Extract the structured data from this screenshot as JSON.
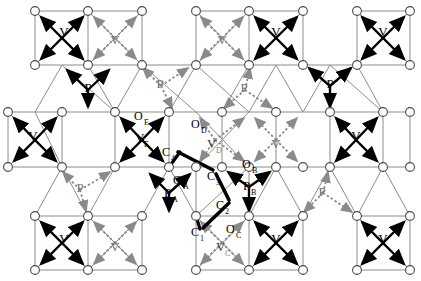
{
  "figure": {
    "name": "crystal-lattice-diagram",
    "type": "structural-lattice",
    "background_color": "#ffffff",
    "bond_color": "#000000",
    "lattice_line_color": "#8c8c8c",
    "node_fill": "#ffffff",
    "node_stroke": "#555555"
  },
  "atom_labels": {
    "oxygen": "O",
    "vanadium": "V",
    "phosphorus": "P",
    "carbon": "C"
  },
  "subscripts": {
    "a": "A",
    "b": "B",
    "c": "C",
    "d": "D",
    "e": "E",
    "one": "1",
    "two": "2",
    "three": "3",
    "four": "4"
  },
  "labelled_sites": [
    {
      "id": "V-tl",
      "text": "V",
      "sub": "",
      "x": 64,
      "y": 36,
      "style": "solid"
    },
    {
      "id": "V-t2",
      "text": "V",
      "sub": "",
      "x": 142,
      "y": 44,
      "style": "dotted"
    },
    {
      "id": "V-t3",
      "text": "V",
      "sub": "",
      "x": 222,
      "y": 44,
      "style": "dotted"
    },
    {
      "id": "V-t4",
      "text": "V",
      "sub": "",
      "x": 276,
      "y": 36,
      "style": "solid"
    },
    {
      "id": "V-t5",
      "text": "V",
      "sub": "",
      "x": 383,
      "y": 36,
      "style": "solid"
    },
    {
      "id": "V-m1",
      "text": "V",
      "sub": "",
      "x": 33,
      "y": 140,
      "style": "solid"
    },
    {
      "id": "V-mE",
      "text": "V",
      "sub": "E",
      "x": 140,
      "y": 140,
      "style": "solid"
    },
    {
      "id": "V-mD",
      "text": "V",
      "sub": "D",
      "x": 212,
      "y": 148,
      "style": "dotted"
    },
    {
      "id": "V-m4",
      "text": "V",
      "sub": "",
      "x": 276,
      "y": 148,
      "style": "dotted"
    },
    {
      "id": "V-m5",
      "text": "V",
      "sub": "",
      "x": 356,
      "y": 140,
      "style": "solid"
    },
    {
      "id": "V-b1",
      "text": "V",
      "sub": "",
      "x": 64,
      "y": 243,
      "style": "solid"
    },
    {
      "id": "V-b2",
      "text": "V",
      "sub": "",
      "x": 115,
      "y": 251,
      "style": "dotted"
    },
    {
      "id": "V-bC",
      "text": "V",
      "sub": "C",
      "x": 222,
      "y": 251,
      "style": "dotted"
    },
    {
      "id": "V-b4",
      "text": "V",
      "sub": "",
      "x": 276,
      "y": 243,
      "style": "solid"
    },
    {
      "id": "V-b5",
      "text": "V",
      "sub": "",
      "x": 383,
      "y": 243,
      "style": "solid"
    },
    {
      "id": "P-t1",
      "text": "P",
      "sub": "",
      "x": 88,
      "y": 92,
      "style": "solid"
    },
    {
      "id": "P-t2",
      "text": "P",
      "sub": "",
      "x": 158,
      "y": 83,
      "style": "dotted"
    },
    {
      "id": "P-t3",
      "text": "P",
      "sub": "",
      "x": 242,
      "y": 92,
      "style": "dotted"
    },
    {
      "id": "P-t4",
      "text": "P",
      "sub": "",
      "x": 330,
      "y": 83,
      "style": "solid"
    },
    {
      "id": "P-b1",
      "text": "P",
      "sub": "",
      "x": 80,
      "y": 188,
      "style": "dotted"
    },
    {
      "id": "P-bA",
      "text": "P",
      "sub": "A",
      "x": 170,
      "y": 196,
      "style": "solid"
    },
    {
      "id": "P-bB",
      "text": "P",
      "sub": "B",
      "x": 248,
      "y": 188,
      "style": "solid"
    },
    {
      "id": "P-b4",
      "text": "P",
      "sub": "",
      "x": 320,
      "y": 196,
      "style": "dotted"
    },
    {
      "id": "O-E",
      "text": "O",
      "sub": "E",
      "x": 140,
      "y": 116,
      "style": "solid"
    },
    {
      "id": "O-D",
      "text": "O",
      "sub": "D",
      "x": 197,
      "y": 124,
      "style": "dotted"
    },
    {
      "id": "O-A",
      "text": "O",
      "sub": "A",
      "x": 178,
      "y": 181,
      "style": "solid"
    },
    {
      "id": "O-B",
      "text": "O",
      "sub": "B",
      "x": 248,
      "y": 165,
      "style": "solid"
    },
    {
      "id": "O-C",
      "text": "O",
      "sub": "C",
      "x": 232,
      "y": 230,
      "style": "dotted"
    },
    {
      "id": "C-4",
      "text": "C",
      "sub": "4",
      "x": 168,
      "y": 153,
      "style": "bond"
    },
    {
      "id": "C-3",
      "text": "C",
      "sub": "3",
      "x": 213,
      "y": 177,
      "style": "bond"
    },
    {
      "id": "C-2",
      "text": "C",
      "sub": "2",
      "x": 222,
      "y": 206,
      "style": "bond"
    },
    {
      "id": "C-1",
      "text": "C",
      "sub": "1",
      "x": 197,
      "y": 233,
      "style": "bond"
    }
  ],
  "counts": {
    "oxygen_nodes": 60,
    "vanadium_centers": 15,
    "phosphorus_centers": 8,
    "carbon_chain_atoms": 4
  }
}
